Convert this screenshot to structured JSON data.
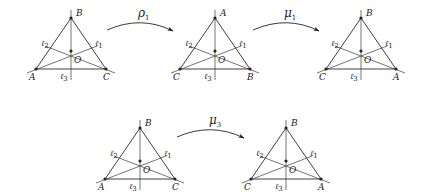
{
  "diagram": {
    "triangles": [
      {
        "id": "t1",
        "origin": [
          71,
          18
        ],
        "top": "B",
        "left": "A",
        "right": "C",
        "center": "O",
        "lines": {
          "l1": "ℓ",
          "l1s": "1",
          "l2": "ℓ",
          "l2s": "2",
          "l3": "ℓ",
          "l3s": "3"
        }
      },
      {
        "id": "t2",
        "origin": [
          215,
          18
        ],
        "top": "A",
        "left": "C",
        "right": "B",
        "center": "O",
        "lines": {
          "l1": "ℓ",
          "l1s": "1",
          "l2": "ℓ",
          "l2s": "2",
          "l3": "ℓ",
          "l3s": "3"
        }
      },
      {
        "id": "t3",
        "origin": [
          361,
          18
        ],
        "top": "B",
        "left": "C",
        "right": "A",
        "center": "O",
        "lines": {
          "l1": "ℓ",
          "l1s": "1",
          "l2": "ℓ",
          "l2s": "2",
          "l3": "ℓ",
          "l3s": "3"
        }
      },
      {
        "id": "t4",
        "origin": [
          140,
          128
        ],
        "top": "B",
        "left": "A",
        "right": "C",
        "center": "O",
        "lines": {
          "l1": "ℓ",
          "l1s": "1",
          "l2": "ℓ",
          "l2s": "2",
          "l3": "ℓ",
          "l3s": "3"
        }
      },
      {
        "id": "t5",
        "origin": [
          286,
          128
        ],
        "top": "B",
        "left": "C",
        "right": "A",
        "center": "O",
        "lines": {
          "l1": "ℓ",
          "l1s": "1",
          "l2": "ℓ",
          "l2s": "2",
          "l3": "ℓ",
          "l3s": "3"
        }
      }
    ],
    "arrows": [
      {
        "id": "rho1",
        "label": "ρ",
        "sub": "1"
      },
      {
        "id": "mu1",
        "label": "μ",
        "sub": "1"
      },
      {
        "id": "mu3",
        "label": "μ",
        "sub": "3"
      }
    ],
    "colors": {
      "stroke": "#2a2a2a",
      "background": "#ffffff"
    }
  }
}
